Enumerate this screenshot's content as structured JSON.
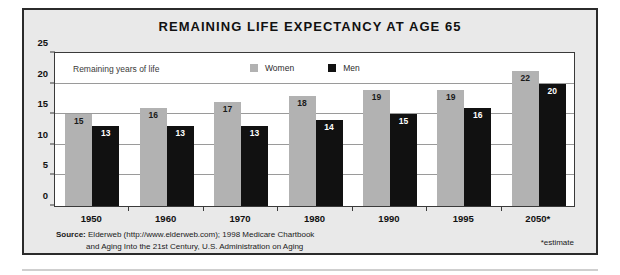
{
  "chart_data": {
    "type": "bar",
    "title": "REMAINING LIFE EXPECTANCY AT AGE 65",
    "xlabel": "",
    "ylabel": "Remaining years of life",
    "categories": [
      "1950",
      "1960",
      "1970",
      "1980",
      "1990",
      "1995",
      "2050*"
    ],
    "series": [
      {
        "name": "Women",
        "color": "#b2b2b2",
        "values": [
          15,
          16,
          17,
          18,
          19,
          19,
          22
        ]
      },
      {
        "name": "Men",
        "color": "#111111",
        "values": [
          13,
          13,
          13,
          14,
          15,
          16,
          20
        ]
      }
    ],
    "ylim": [
      0,
      25
    ],
    "yticks": [
      0,
      5,
      10,
      15,
      20,
      25
    ],
    "gridlines": [
      5,
      10,
      15,
      20
    ],
    "grid": true,
    "legend_position": "top-center-inside",
    "annotations": {
      "axis_note": "Remaining years of life",
      "estimate_note": "*estimate"
    }
  },
  "legend": {
    "items": [
      {
        "label": "Women",
        "color": "#b2b2b2"
      },
      {
        "label": "Men",
        "color": "#111111"
      }
    ]
  },
  "footer": {
    "source_label": "Source:",
    "source_line1": "Elderweb (http://www.elderweb.com); 1998 Medicare Chartbook",
    "source_line2": "and Aging Into the 21st Century, U.S. Administration on Aging",
    "estimate_note": "*estimate"
  }
}
